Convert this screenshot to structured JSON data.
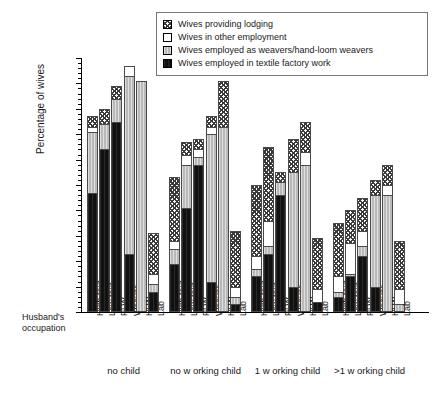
{
  "legend": {
    "items": [
      {
        "label": "Wives providing lodging",
        "pattern": "hatch",
        "key": "lodging"
      },
      {
        "label": "Wives in other employment",
        "pattern": "white",
        "key": "other"
      },
      {
        "label": "Wives employed as weavers/hand-loom weavers",
        "pattern": "gray",
        "key": "weavers"
      },
      {
        "label": "Wives employed in textile factory work",
        "pattern": "black",
        "key": "factory"
      }
    ]
  },
  "axes": {
    "ylabel": "Percentage of wives",
    "xlabel": "Husband's occupation",
    "yticks": [
      "0",
      "10",
      "20",
      "30",
      "40",
      "50",
      "60",
      "70",
      "80",
      "90",
      "100"
    ]
  },
  "chart_data": {
    "type": "bar",
    "title": "",
    "xlabel": "Husband's occupation",
    "ylabel": "Percentage of wives",
    "ylim": [
      0,
      100
    ],
    "grid": false,
    "stacked": true,
    "legend_position": "top-center",
    "categories": [
      "High text",
      "Low text",
      "PLW",
      "Weaver",
      "HLW",
      "Lab"
    ],
    "groups": [
      "no child",
      "no w orking child",
      "1 w orking child",
      ">1 w orking child"
    ],
    "series": [
      {
        "name": "Wives employed in textile factory work",
        "pattern": "black"
      },
      {
        "name": "Wives employed as weavers/hand-loom weavers",
        "pattern": "gray"
      },
      {
        "name": "Wives in other employment",
        "pattern": "white"
      },
      {
        "name": "Wives providing lodging",
        "pattern": "hatch"
      }
    ],
    "data": [
      {
        "group": "no child",
        "bars": [
          {
            "category": "High text",
            "factory": 47,
            "weavers": 24,
            "other": 2,
            "lodging": 4,
            "total": 77
          },
          {
            "category": "Low text",
            "factory": 64,
            "weavers": 10,
            "other": 0,
            "lodging": 6,
            "total": 80
          },
          {
            "category": "PLW",
            "factory": 75,
            "weavers": 9,
            "other": 0,
            "lodging": 5,
            "total": 89
          },
          {
            "category": "Weaver",
            "factory": 23,
            "weavers": 70,
            "other": 4,
            "lodging": 0,
            "total": 97
          },
          {
            "category": "HLW",
            "factory": 0,
            "weavers": 91,
            "other": 0,
            "lodging": 0,
            "total": 91
          },
          {
            "category": "Lab",
            "factory": 8,
            "weavers": 3,
            "other": 4,
            "lodging": 16,
            "total": 31
          }
        ]
      },
      {
        "group": "no w orking child",
        "bars": [
          {
            "category": "High text",
            "factory": 19,
            "weavers": 6,
            "other": 3,
            "lodging": 25,
            "total": 53
          },
          {
            "category": "Low text",
            "factory": 41,
            "weavers": 17,
            "other": 4,
            "lodging": 5,
            "total": 67
          },
          {
            "category": "PLW",
            "factory": 58,
            "weavers": 3,
            "other": 3,
            "lodging": 4,
            "total": 68
          },
          {
            "category": "Weaver",
            "factory": 12,
            "weavers": 58,
            "other": 3,
            "lodging": 4,
            "total": 77
          },
          {
            "category": "HLW",
            "factory": 0,
            "weavers": 73,
            "other": 0,
            "lodging": 18,
            "total": 91
          },
          {
            "category": "Lab",
            "factory": 3,
            "weavers": 3,
            "other": 4,
            "lodging": 22,
            "total": 32
          }
        ]
      },
      {
        "group": "1 w orking child",
        "bars": [
          {
            "category": "High text",
            "factory": 14,
            "weavers": 3,
            "other": 5,
            "lodging": 28,
            "total": 50
          },
          {
            "category": "Low text",
            "factory": 23,
            "weavers": 3,
            "other": 10,
            "lodging": 29,
            "total": 65
          },
          {
            "category": "PLW",
            "factory": 46,
            "weavers": 5,
            "other": 0,
            "lodging": 4,
            "total": 55
          },
          {
            "category": "Weaver",
            "factory": 10,
            "weavers": 45,
            "other": 0,
            "lodging": 13,
            "total": 68
          },
          {
            "category": "HLW",
            "factory": 0,
            "weavers": 58,
            "other": 5,
            "lodging": 12,
            "total": 75
          },
          {
            "category": "Lab",
            "factory": 4,
            "weavers": 0,
            "other": 5,
            "lodging": 20,
            "total": 29
          }
        ]
      },
      {
        "group": ">1 w orking child",
        "bars": [
          {
            "category": "High text",
            "factory": 6,
            "weavers": 2,
            "other": 6,
            "lodging": 21,
            "total": 35
          },
          {
            "category": "Low text",
            "factory": 14,
            "weavers": 1,
            "other": 12,
            "lodging": 13,
            "total": 40
          },
          {
            "category": "PLW",
            "factory": 22,
            "weavers": 4,
            "other": 6,
            "lodging": 13,
            "total": 45
          },
          {
            "category": "Weaver",
            "factory": 10,
            "weavers": 36,
            "other": 0,
            "lodging": 6,
            "total": 52
          },
          {
            "category": "HLW",
            "factory": 0,
            "weavers": 46,
            "other": 4,
            "lodging": 8,
            "total": 58
          },
          {
            "category": "Lab",
            "factory": 0,
            "weavers": 3,
            "other": 6,
            "lodging": 19,
            "total": 28
          }
        ]
      }
    ]
  }
}
